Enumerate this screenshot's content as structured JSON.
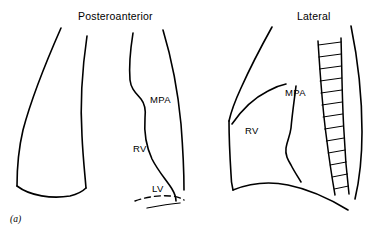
{
  "figure": {
    "caption": "(a)",
    "stroke_color": "#000000",
    "background_color": "#ffffff"
  },
  "panels": [
    {
      "id": "posteroanterior",
      "title": "Posteroanterior",
      "labels": [
        {
          "id": "mpa",
          "text": "MPA"
        },
        {
          "id": "rv",
          "text": "RV"
        },
        {
          "id": "lv",
          "text": "LV"
        }
      ]
    },
    {
      "id": "lateral",
      "title": "Lateral",
      "labels": [
        {
          "id": "mpa",
          "text": "MPA"
        },
        {
          "id": "rv",
          "text": "RV"
        }
      ]
    }
  ]
}
